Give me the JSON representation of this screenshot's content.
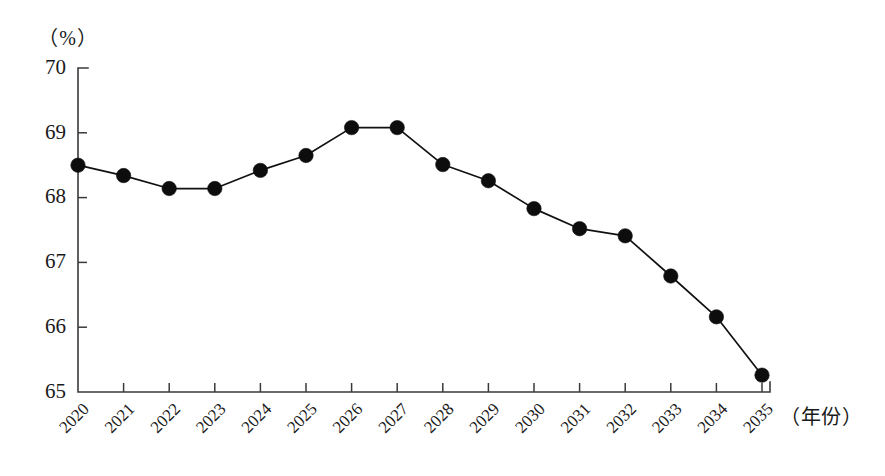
{
  "chart_data": {
    "type": "line",
    "title": "",
    "subtitle": "",
    "xlabel": "（年份）",
    "ylabel": "（%）",
    "categories": [
      "2020",
      "2021",
      "2022",
      "2023",
      "2024",
      "2025",
      "2026",
      "2027",
      "2028",
      "2029",
      "2030",
      "2031",
      "2032",
      "2033",
      "2034",
      "2035"
    ],
    "values": [
      68.5,
      68.34,
      68.14,
      68.14,
      68.42,
      68.65,
      69.08,
      69.08,
      68.51,
      68.26,
      67.83,
      67.52,
      67.41,
      66.79,
      66.16,
      65.26
    ],
    "series": [
      {
        "name": "比重",
        "values": [
          68.5,
          68.34,
          68.14,
          68.14,
          68.42,
          68.65,
          69.08,
          69.08,
          68.51,
          68.26,
          67.83,
          67.52,
          67.41,
          66.79,
          66.16,
          65.26
        ]
      }
    ],
    "ylim": [
      65,
      70
    ],
    "yticks": [
      65,
      66,
      67,
      68,
      69,
      70
    ],
    "ytick_labels": [
      "65",
      "66",
      "67",
      "68",
      "69",
      "70"
    ],
    "xtick_labels": [
      "2020",
      "2021",
      "2022",
      "2023",
      "2024",
      "2025",
      "2026",
      "2027",
      "2028",
      "2029",
      "2030",
      "2031",
      "2032",
      "2033",
      "2034",
      "2035"
    ],
    "xtick_rotation": 45,
    "grid": false,
    "legend": false,
    "legend_position": "none",
    "marker": "filled-circle",
    "line_color": "#111111",
    "marker_color": "#0d0d0d",
    "axis_color": "#3a3a3a",
    "background": "#ffffff"
  },
  "labels": {
    "y_unit": "（%）",
    "x_unit": "（年份）"
  }
}
